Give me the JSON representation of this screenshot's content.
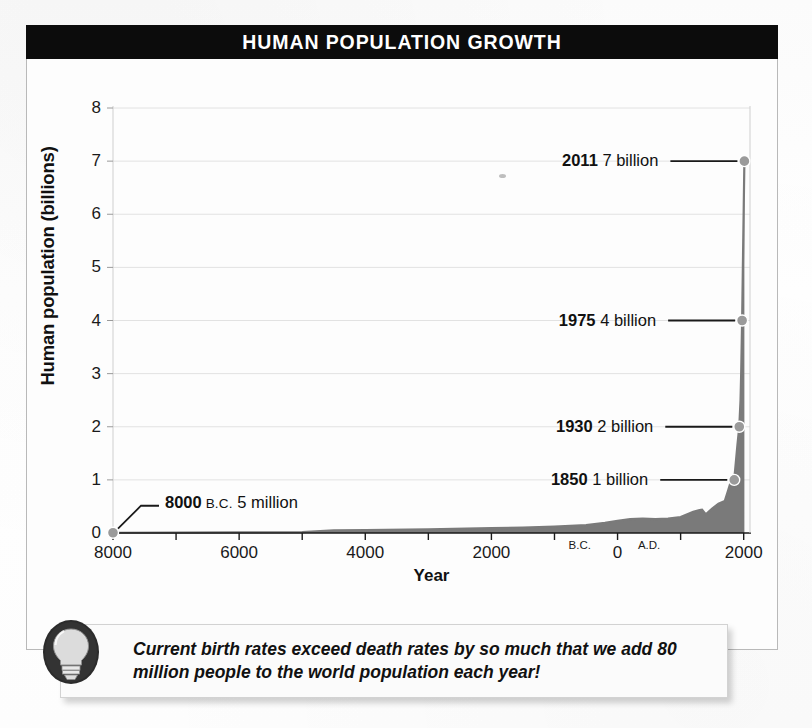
{
  "figure": {
    "title": "HUMAN POPULATION GROWTH",
    "caption": "Current birth rates exceed death rates by so much that we add 80 million people to the world population each year!",
    "bulb_icon": "lightbulb-icon",
    "frame_color": "#b9b9b9",
    "banner_color": "#0c0c0c",
    "curve_color": "#7a7a7a",
    "grid_color": "#e2e2e2",
    "marker_fill": "#9a9a9a"
  },
  "chart_data": {
    "type": "area",
    "title": "HUMAN POPULATION GROWTH",
    "xlabel": "Year",
    "ylabel": "Human population (billions)",
    "xlim": [
      -8000,
      2100
    ],
    "ylim": [
      0,
      8
    ],
    "grid": true,
    "legend_position": "none",
    "y_ticks": [
      0,
      1,
      2,
      3,
      4,
      5,
      6,
      7,
      8
    ],
    "y_tick_labels": [
      "0",
      "1",
      "2",
      "3",
      "4",
      "5",
      "6",
      "7",
      "8"
    ],
    "x_ticks": [
      -8000,
      -7000,
      -6000,
      -5000,
      -4000,
      -3000,
      -2000,
      -1000,
      0,
      1000,
      2000
    ],
    "x_tick_labels": [
      "8000",
      "",
      "6000",
      "",
      "4000",
      "",
      "2000",
      "",
      "0",
      "",
      "2000"
    ],
    "era_labels": [
      {
        "text": "B.C.",
        "x": -600
      },
      {
        "text": "A.D.",
        "x": 500
      }
    ],
    "series": [
      {
        "name": "World population",
        "x": [
          -8000,
          -7000,
          -6000,
          -5000,
          -4500,
          -4000,
          -3000,
          -2000,
          -1500,
          -1000,
          -500,
          -200,
          0,
          200,
          400,
          600,
          800,
          1000,
          1200,
          1300,
          1340,
          1400,
          1500,
          1600,
          1700,
          1750,
          1800,
          1850,
          1900,
          1930,
          1950,
          1960,
          1975,
          1987,
          1999,
          2011
        ],
        "y": [
          0.005,
          0.007,
          0.01,
          0.015,
          0.05,
          0.055,
          0.07,
          0.09,
          0.1,
          0.12,
          0.15,
          0.19,
          0.23,
          0.26,
          0.27,
          0.26,
          0.27,
          0.3,
          0.4,
          0.43,
          0.44,
          0.35,
          0.46,
          0.55,
          0.6,
          0.79,
          0.98,
          1.0,
          1.65,
          2.0,
          2.5,
          3.0,
          4.0,
          5.0,
          6.0,
          7.0
        ]
      }
    ],
    "annotations": [
      {
        "year": "8000",
        "era": "B.C.",
        "amount": "5 million",
        "point_x": -8000,
        "point_y": 0.005,
        "side": "right"
      },
      {
        "year": "1850",
        "era": "",
        "amount": "1 billion",
        "point_x": 1850,
        "point_y": 1.0,
        "side": "left"
      },
      {
        "year": "1930",
        "era": "",
        "amount": "2 billion",
        "point_x": 1930,
        "point_y": 2.0,
        "side": "left"
      },
      {
        "year": "1975",
        "era": "",
        "amount": "4 billion",
        "point_x": 1975,
        "point_y": 4.0,
        "side": "left"
      },
      {
        "year": "2011",
        "era": "",
        "amount": "7 billion",
        "point_x": 2011,
        "point_y": 7.0,
        "side": "left"
      }
    ]
  }
}
